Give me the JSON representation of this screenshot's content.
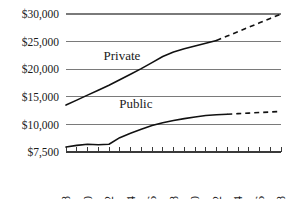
{
  "chart_data": {
    "type": "line",
    "title": "",
    "subtitle": "",
    "xlabel": "",
    "ylabel": "",
    "grid": true,
    "legend_position": "inline-labels",
    "x": [
      1988,
      1989,
      1990,
      1991,
      1992,
      1993,
      1994,
      1995,
      1996,
      1997,
      1998,
      1999,
      2000,
      2001,
      2002,
      2003,
      2004,
      2005,
      2006,
      2007,
      2008
    ],
    "xtick_labels": [
      "1988",
      "1990",
      "1992",
      "1994",
      "1996",
      "1998",
      "2000",
      "2002",
      "2004",
      "2006",
      "2008"
    ],
    "xtick_values": [
      1988,
      1990,
      1992,
      1994,
      1996,
      1998,
      2000,
      2002,
      2004,
      2006,
      2008
    ],
    "xlim": [
      1988,
      2008
    ],
    "ytick_labels": [
      "$30,000",
      "$25,000",
      "$20,000",
      "$15,000",
      "$10,000",
      "$7,500"
    ],
    "ytick_values": [
      30000,
      25000,
      20000,
      15000,
      10000,
      7500
    ],
    "ylim": [
      7500,
      30000
    ],
    "series": [
      {
        "name": "Private",
        "label": "Private",
        "style": "solid-then-dashed",
        "solid_through": 2002,
        "values": [
          13500,
          14400,
          15300,
          16200,
          17100,
          18100,
          19100,
          20100,
          21200,
          22300,
          23100,
          23700,
          24200,
          24700,
          25200,
          26000,
          26800,
          27600,
          28400,
          29200,
          30000
        ]
      },
      {
        "name": "Public",
        "label": "Public",
        "style": "solid-then-dashed",
        "solid_through": 2003,
        "values": [
          7950,
          8100,
          8200,
          8150,
          8200,
          8800,
          9200,
          9550,
          9900,
          10300,
          10700,
          11050,
          11350,
          11600,
          11750,
          11850,
          11950,
          12050,
          12150,
          12250,
          12350
        ]
      }
    ],
    "annotations": [
      {
        "name": "private-series-label",
        "text": "Private",
        "x": 1993.2,
        "y": 21700
      },
      {
        "name": "public-series-label",
        "text": "Public",
        "x": 1994.5,
        "y": 13000
      }
    ],
    "colors": {
      "line": "#111111",
      "grid": "#7a7a7a",
      "axis": "#3a3a3a",
      "background": "#ffffff"
    }
  }
}
